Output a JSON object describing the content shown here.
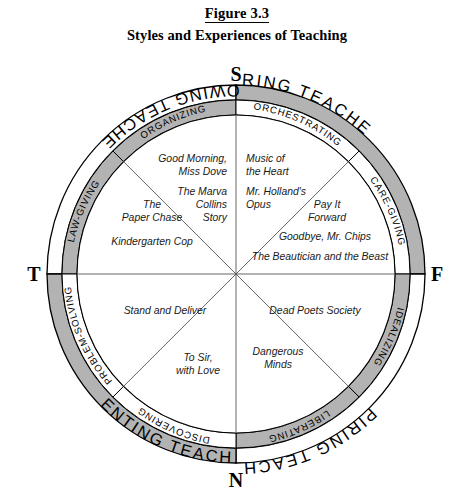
{
  "figure": {
    "number": "Figure 3.3",
    "subtitle": "Styles and Experiences of Teaching"
  },
  "colors": {
    "band_shaded": "#b3b3b3",
    "band_plain": "#ffffff",
    "stroke": "#000000",
    "spoke": "#555555",
    "text": "#000000"
  },
  "axes": {
    "top": "S",
    "right": "F",
    "bottom": "N",
    "left": "T"
  },
  "quadrants": [
    {
      "id": "knowing",
      "label": "KNOWING TEACHERS",
      "shaded": false
    },
    {
      "id": "caring",
      "label": "CARING TEACHERS",
      "shaded": true
    },
    {
      "id": "inspiring",
      "label": "INSPIRING TEACHERS",
      "shaded": false
    },
    {
      "id": "inventing",
      "label": "INVENTING TEACHERS",
      "shaded": true
    }
  ],
  "octants": [
    {
      "id": "law-giving",
      "label": "LAW-GIVING",
      "shaded": true
    },
    {
      "id": "organizing",
      "label": "ORGANIZING",
      "shaded": true
    },
    {
      "id": "orchestrating",
      "label": "ORCHESTRATING",
      "shaded": false
    },
    {
      "id": "care-giving",
      "label": "CARE-GIVING",
      "shaded": false
    },
    {
      "id": "idealizing",
      "label": "IDEALIZING",
      "shaded": true
    },
    {
      "id": "liberating",
      "label": "LIBERATING",
      "shaded": true
    },
    {
      "id": "discovering",
      "label": "DISCOVERING",
      "shaded": false
    },
    {
      "id": "problem-solving",
      "label": "PROBLEM-SOLVING",
      "shaded": false
    }
  ],
  "films": {
    "organizing": [
      "Good Morning,",
      "Miss Dove",
      "The Marva",
      "Collins",
      "Story"
    ],
    "law_giving": [
      "The",
      "Paper Chase",
      "Kindergarten Cop"
    ],
    "orchestrating": [
      "Music of",
      "the Heart",
      "Mr. Holland's",
      "Opus"
    ],
    "care_giving": [
      "Pay It",
      "Forward",
      "Goodbye, Mr. Chips",
      "The Beautician and the Beast"
    ],
    "problem_solving": [
      "Stand and Deliver"
    ],
    "discovering": [
      "To Sir,",
      "with Love"
    ],
    "liberating": [
      "Dangerous",
      "Minds"
    ],
    "idealizing": [
      "Dead Poets Society"
    ]
  }
}
